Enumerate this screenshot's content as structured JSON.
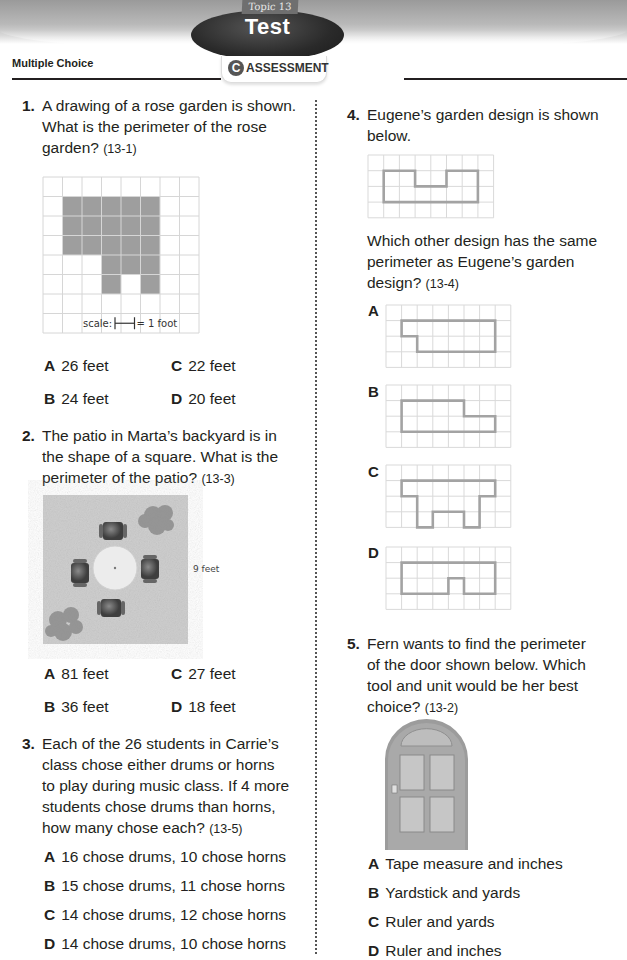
{
  "header": {
    "topic_tag": "Topic 13",
    "title": "Test",
    "assessment_icon": "C",
    "assessment_label": "ASSESSMENT",
    "section_title": "Multiple Choice"
  },
  "questions": [
    {
      "number": "1.",
      "lines": [
        "A drawing of a rose garden is shown.",
        "What is the perimeter of the rose",
        "garden?"
      ],
      "ref": "(13-1)",
      "figure": {
        "type": "grid",
        "cols": 8,
        "rows": 8,
        "shaded_cells": [
          [
            1,
            1
          ],
          [
            2,
            1
          ],
          [
            3,
            1
          ],
          [
            4,
            1
          ],
          [
            5,
            1
          ],
          [
            1,
            2
          ],
          [
            2,
            2
          ],
          [
            3,
            2
          ],
          [
            4,
            2
          ],
          [
            5,
            2
          ],
          [
            1,
            3
          ],
          [
            2,
            3
          ],
          [
            3,
            3
          ],
          [
            4,
            3
          ],
          [
            5,
            3
          ],
          [
            3,
            4
          ],
          [
            4,
            4
          ],
          [
            5,
            4
          ],
          [
            3,
            5
          ],
          [
            5,
            5
          ]
        ],
        "scale_label": "scale:",
        "scale_value": "= 1 foot"
      },
      "options": [
        {
          "letter": "A",
          "text": "26 feet"
        },
        {
          "letter": "B",
          "text": "24 feet"
        },
        {
          "letter": "C",
          "text": "22 feet"
        },
        {
          "letter": "D",
          "text": "20 feet"
        }
      ]
    },
    {
      "number": "2.",
      "lines": [
        "The patio in Marta’s backyard is in",
        "the shape of a square. What is the",
        "perimeter of the patio?"
      ],
      "ref": "(13-3)",
      "figure": {
        "type": "patio-image",
        "side_label": "9 feet"
      },
      "options": [
        {
          "letter": "A",
          "text": "81 feet"
        },
        {
          "letter": "B",
          "text": "36 feet"
        },
        {
          "letter": "C",
          "text": "27 feet"
        },
        {
          "letter": "D",
          "text": "18 feet"
        }
      ]
    },
    {
      "number": "3.",
      "lines": [
        "Each of the 26 students in Carrie’s",
        "class chose either drums or horns",
        "to play during music class. If 4 more",
        "students chose drums than horns,",
        "how many chose each?"
      ],
      "ref": "(13-5)",
      "options": [
        {
          "letter": "A",
          "text": "16 chose drums, 10 chose horns"
        },
        {
          "letter": "B",
          "text": "15 chose drums, 11 chose horns"
        },
        {
          "letter": "C",
          "text": "14 chose drums, 12 chose horns"
        },
        {
          "letter": "D",
          "text": "14 chose drums, 10 chose horns"
        }
      ]
    },
    {
      "number": "4.",
      "lines": [
        "Eugene’s garden design is shown",
        "below."
      ],
      "lines2": [
        "Which other design has the same",
        "perimeter as Eugene’s garden",
        "design?"
      ],
      "ref": "(13-4)",
      "figure": {
        "type": "outline-grid",
        "cols": 8,
        "rows": 4,
        "outline": [
          [
            1,
            1
          ],
          [
            3,
            1
          ],
          [
            3,
            2
          ],
          [
            5,
            2
          ],
          [
            5,
            1
          ],
          [
            7,
            1
          ],
          [
            7,
            3
          ],
          [
            1,
            3
          ]
        ]
      },
      "options": [
        {
          "letter": "A",
          "cols": 8,
          "rows": 4,
          "outline": [
            [
              1,
              1
            ],
            [
              7,
              1
            ],
            [
              7,
              3
            ],
            [
              2,
              3
            ],
            [
              2,
              2
            ],
            [
              1,
              2
            ]
          ]
        },
        {
          "letter": "B",
          "cols": 8,
          "rows": 4,
          "outline": [
            [
              1,
              1
            ],
            [
              5,
              1
            ],
            [
              5,
              2
            ],
            [
              7,
              2
            ],
            [
              7,
              3
            ],
            [
              1,
              3
            ]
          ]
        },
        {
          "letter": "C",
          "cols": 8,
          "rows": 4,
          "outline": [
            [
              1,
              1
            ],
            [
              7,
              1
            ],
            [
              7,
              2
            ],
            [
              6,
              2
            ],
            [
              6,
              4
            ],
            [
              5,
              4
            ],
            [
              5,
              3
            ],
            [
              3,
              3
            ],
            [
              3,
              4
            ],
            [
              2,
              4
            ],
            [
              2,
              2
            ],
            [
              1,
              2
            ]
          ]
        },
        {
          "letter": "D",
          "cols": 8,
          "rows": 4,
          "outline": [
            [
              1,
              1
            ],
            [
              7,
              1
            ],
            [
              7,
              3
            ],
            [
              5,
              3
            ],
            [
              5,
              2
            ],
            [
              4,
              2
            ],
            [
              4,
              3
            ],
            [
              1,
              3
            ]
          ]
        }
      ]
    },
    {
      "number": "5.",
      "lines": [
        "Fern wants to find the perimeter",
        "of the door shown below. Which",
        "tool and unit would be her best",
        "choice?"
      ],
      "ref": "(13-2)",
      "figure": {
        "type": "door-image"
      },
      "options": [
        {
          "letter": "A",
          "text": "Tape measure and inches"
        },
        {
          "letter": "B",
          "text": "Yardstick and yards"
        },
        {
          "letter": "C",
          "text": "Ruler and yards"
        },
        {
          "letter": "D",
          "text": "Ruler and inches"
        }
      ]
    }
  ]
}
